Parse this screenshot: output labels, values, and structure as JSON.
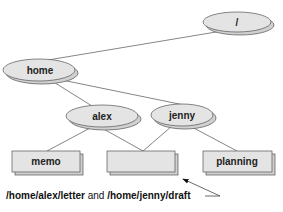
{
  "diagram": {
    "type": "directory-tree",
    "colors": {
      "node_fill": "#e4e4e4",
      "node_stroke": "#555555",
      "shadow": "#cccccc",
      "edge": "#666666",
      "text": "#222222"
    },
    "nodes": [
      {
        "id": "root",
        "label": "/",
        "shape": "ellipse"
      },
      {
        "id": "home",
        "label": "home",
        "shape": "ellipse"
      },
      {
        "id": "alex",
        "label": "alex",
        "shape": "ellipse"
      },
      {
        "id": "jenny",
        "label": "jenny",
        "shape": "ellipse"
      },
      {
        "id": "memo",
        "label": "memo",
        "shape": "box"
      },
      {
        "id": "shared",
        "label": "",
        "shape": "box"
      },
      {
        "id": "planning",
        "label": "planning",
        "shape": "box"
      }
    ],
    "edges": [
      [
        "root",
        "home"
      ],
      [
        "home",
        "alex"
      ],
      [
        "home",
        "jenny"
      ],
      [
        "alex",
        "memo"
      ],
      [
        "alex",
        "shared"
      ],
      [
        "jenny",
        "shared"
      ],
      [
        "jenny",
        "planning"
      ]
    ],
    "caption": {
      "path1": "/home/alex/letter",
      "conjunction": " and ",
      "path2": "/home/jenny/draft"
    }
  }
}
